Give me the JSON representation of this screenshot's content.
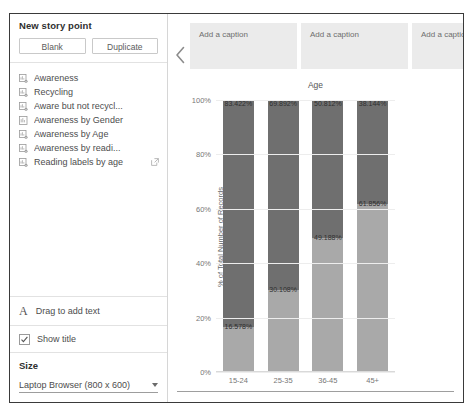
{
  "sidebar": {
    "title": "New story point",
    "buttons": [
      {
        "label": "Blank",
        "name": "blank-button"
      },
      {
        "label": "Duplicate",
        "name": "duplicate-button"
      }
    ],
    "sheets": [
      {
        "label": "Awareness",
        "icon": "worksheet-icon",
        "external": false
      },
      {
        "label": "Recycling",
        "icon": "worksheet-icon",
        "external": false
      },
      {
        "label": "Aware but not recycl...",
        "icon": "worksheet-icon",
        "external": false
      },
      {
        "label": "Awareness by Gender",
        "icon": "dashboard-icon",
        "external": false
      },
      {
        "label": "Awareness by Age",
        "icon": "worksheet-icon",
        "external": false
      },
      {
        "label": "Awareness by readi...",
        "icon": "worksheet-icon",
        "external": false
      },
      {
        "label": "Reading labels by age",
        "icon": "worksheet-icon",
        "external": true
      }
    ],
    "drag_text": "Drag to add text",
    "show_title": {
      "label": "Show title",
      "checked": true
    },
    "size": {
      "title": "Size",
      "value": "Laptop Browser (800 x 600)"
    }
  },
  "main": {
    "collapse_icon": "chevron-left-icon",
    "captions": [
      {
        "placeholder": "Add a caption"
      },
      {
        "placeholder": "Add a caption"
      },
      {
        "placeholder": "Add a caption"
      }
    ]
  },
  "chart_data": {
    "type": "bar",
    "subtype": "stacked-100-percent",
    "title": "Age",
    "xlabel": "",
    "ylabel": "% of Total Number of Records",
    "categories": [
      "15-24",
      "25-35",
      "36-45",
      "45+"
    ],
    "yticks": [
      "0%",
      "20%",
      "40%",
      "60%",
      "80%",
      "100%"
    ],
    "ylim": [
      0,
      100
    ],
    "grid": true,
    "legend": "none",
    "colors": {
      "top_segment": "#6f6f6f",
      "bottom_segment": "#a9a9a9"
    },
    "series": [
      {
        "name": "Top segment",
        "values": [
          83.422,
          69.892,
          50.812,
          38.144
        ],
        "labels": [
          "83.422%",
          "69.892%",
          "50.812%",
          "38.144%"
        ]
      },
      {
        "name": "Bottom segment",
        "values": [
          16.578,
          30.108,
          49.188,
          61.856
        ],
        "labels": [
          "16.578%",
          "30.108%",
          "49.188%",
          "61.856%"
        ]
      }
    ]
  }
}
